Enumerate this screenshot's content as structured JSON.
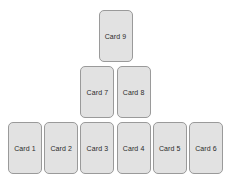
{
  "diagram": {
    "background_color": "#ffffff",
    "card_fill_color": "#e2e2e2",
    "card_border_color": "#9a9a9a",
    "card_text_color": "#2b2b2b",
    "rows": [
      {
        "name": "top-row",
        "cards": [
          {
            "label": "Card 9"
          }
        ]
      },
      {
        "name": "middle-row",
        "cards": [
          {
            "label": "Card 7"
          },
          {
            "label": "Card 8"
          }
        ]
      },
      {
        "name": "bottom-row",
        "cards": [
          {
            "label": "Card 1"
          },
          {
            "label": "Card 2"
          },
          {
            "label": "Card 3"
          },
          {
            "label": "Card 4"
          },
          {
            "label": "Card 5"
          },
          {
            "label": "Card 6"
          }
        ]
      }
    ]
  },
  "chart_data": {
    "type": "diagram",
    "layout": "pyramid",
    "row_counts": [
      6,
      2,
      1
    ],
    "labels": [
      "Card 1",
      "Card 2",
      "Card 3",
      "Card 4",
      "Card 5",
      "Card 6",
      "Card 7",
      "Card 8",
      "Card 9"
    ]
  }
}
